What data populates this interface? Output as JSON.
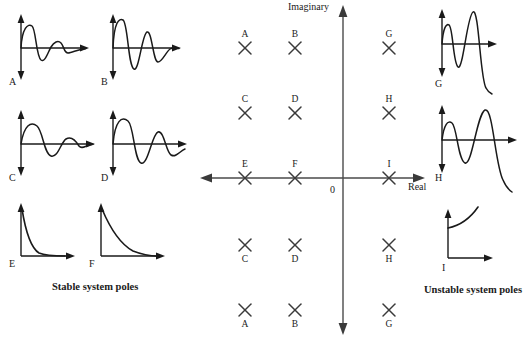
{
  "figure": {
    "title": "",
    "background": "#ffffff",
    "stroke": "#1a1a1a"
  },
  "left_group": {
    "caption": "Stable system poles",
    "plots": [
      {
        "id": "A",
        "label": "A",
        "kind": "damped-oscillation-fast-decay",
        "x": 8,
        "y": 12
      },
      {
        "id": "B",
        "label": "B",
        "kind": "damped-oscillation-slow-decay",
        "x": 100,
        "y": 12
      },
      {
        "id": "C",
        "label": "C",
        "kind": "damped-oscillation-low-freq-fast-decay",
        "x": 8,
        "y": 108
      },
      {
        "id": "D",
        "label": "D",
        "kind": "damped-oscillation-low-freq-slow-decay",
        "x": 100,
        "y": 108
      },
      {
        "id": "E",
        "label": "E",
        "kind": "exponential-decay-fast",
        "x": 8,
        "y": 200
      },
      {
        "id": "F",
        "label": "F",
        "kind": "exponential-decay-slow",
        "x": 88,
        "y": 200
      }
    ]
  },
  "right_group": {
    "caption": "Unstable system poles",
    "plots": [
      {
        "id": "G",
        "label": "G",
        "kind": "growing-oscillation-high-freq",
        "x": 420,
        "y": 8
      },
      {
        "id": "H",
        "label": "H",
        "kind": "growing-oscillation-low-freq",
        "x": 420,
        "y": 104
      },
      {
        "id": "I",
        "label": "I",
        "kind": "exponential-growth",
        "x": 432,
        "y": 206
      }
    ]
  },
  "s_plane": {
    "imaginary_axis_label": "Imaginary",
    "real_axis_label": "Real",
    "origin_label": "0",
    "origin": {
      "x": 148,
      "y": 178
    },
    "poles": [
      {
        "label": "A",
        "x": 50,
        "y": 48,
        "label_pos": "above"
      },
      {
        "label": "B",
        "x": 100,
        "y": 48,
        "label_pos": "above"
      },
      {
        "label": "G",
        "x": 194,
        "y": 48,
        "label_pos": "above"
      },
      {
        "label": "C",
        "x": 50,
        "y": 113,
        "label_pos": "above"
      },
      {
        "label": "D",
        "x": 100,
        "y": 113,
        "label_pos": "above"
      },
      {
        "label": "H",
        "x": 194,
        "y": 113,
        "label_pos": "above"
      },
      {
        "label": "E",
        "x": 50,
        "y": 178,
        "label_pos": "above"
      },
      {
        "label": "F",
        "x": 100,
        "y": 178,
        "label_pos": "above"
      },
      {
        "label": "I",
        "x": 194,
        "y": 178,
        "label_pos": "above"
      },
      {
        "label": "C",
        "x": 50,
        "y": 245,
        "label_pos": "below"
      },
      {
        "label": "D",
        "x": 100,
        "y": 245,
        "label_pos": "below"
      },
      {
        "label": "H",
        "x": 194,
        "y": 245,
        "label_pos": "below"
      },
      {
        "label": "A",
        "x": 50,
        "y": 310,
        "label_pos": "below"
      },
      {
        "label": "B",
        "x": 100,
        "y": 310,
        "label_pos": "below"
      },
      {
        "label": "G",
        "x": 194,
        "y": 310,
        "label_pos": "below"
      }
    ]
  }
}
